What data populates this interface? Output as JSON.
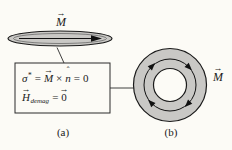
{
  "colors": {
    "background": "#fcfbf6",
    "fill_gray": "#c9c8c5",
    "line": "#1a1a1a"
  },
  "panel_a": {
    "caption": "(a)",
    "disk_label": {
      "symbol": "M",
      "arrow": "→"
    },
    "box": {
      "line1": {
        "sigma": "σ",
        "star": "*",
        "eq1": "=",
        "m": "M",
        "m_arrow": "→",
        "cross": "×",
        "n": "n",
        "n_hat": "ˆ",
        "eq2": "=",
        "zero": "0"
      },
      "line2": {
        "h": "H",
        "h_arrow": "→",
        "sub": "demag",
        "eq": "=",
        "zero": "0",
        "zero_arrow": "→"
      }
    }
  },
  "panel_b": {
    "caption": "(b)",
    "ring_label": {
      "symbol": "M",
      "arrow": "→"
    }
  }
}
